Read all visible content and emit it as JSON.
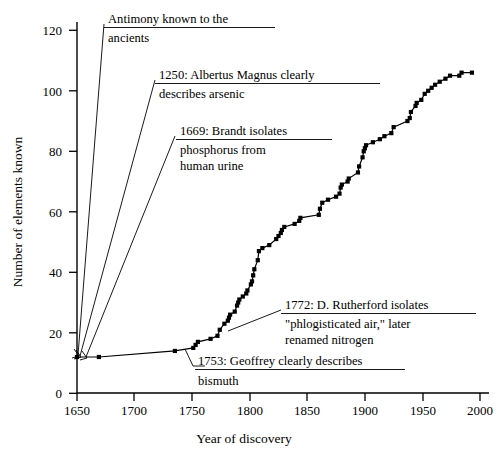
{
  "chart_data": {
    "type": "line",
    "title": "",
    "xlabel": "Year of discovery",
    "ylabel": "Number of elements known",
    "xlim": [
      1650,
      2010
    ],
    "ylim": [
      0,
      125
    ],
    "grid": false,
    "legend": "none",
    "marker": "filled-square",
    "xticks": [
      1650,
      1700,
      1750,
      1800,
      1850,
      1900,
      1950,
      2000
    ],
    "xticklabels": [
      "1650",
      "1700",
      "1750",
      "1800",
      "1850",
      "1900",
      "1950",
      "2000"
    ],
    "yticks": [
      0,
      20,
      40,
      60,
      80,
      100,
      120
    ],
    "yticklabels": [
      "0",
      "20",
      "40",
      "60",
      "80",
      "100",
      "120"
    ],
    "x": [
      1650,
      1669,
      1735,
      1751,
      1753,
      1755,
      1766,
      1772,
      1774,
      1778,
      1781,
      1782,
      1783,
      1787,
      1789,
      1790,
      1791,
      1794,
      1797,
      1798,
      1801,
      1802,
      1803,
      1804,
      1807,
      1808,
      1811,
      1817,
      1823,
      1825,
      1827,
      1828,
      1830,
      1839,
      1843,
      1844,
      1860,
      1861,
      1863,
      1868,
      1875,
      1878,
      1879,
      1880,
      1885,
      1886,
      1894,
      1895,
      1898,
      1899,
      1900,
      1901,
      1907,
      1913,
      1917,
      1923,
      1925,
      1937,
      1939,
      1940,
      1944,
      1945,
      1949,
      1952,
      1955,
      1958,
      1961,
      1965,
      1970,
      1974,
      1982,
      1984,
      1993
    ],
    "y": [
      12,
      12,
      14,
      15,
      16,
      17,
      18,
      19,
      21,
      23,
      24,
      25,
      26,
      27,
      29,
      30,
      31,
      32,
      33,
      34,
      36,
      37,
      39,
      41,
      44,
      47,
      48,
      49,
      51,
      52,
      53,
      54,
      55,
      56,
      57,
      58,
      59,
      61,
      63,
      64,
      65,
      66,
      68,
      69,
      70,
      71,
      73,
      75,
      78,
      80,
      81,
      82,
      83,
      84,
      85,
      86,
      88,
      90,
      91,
      93,
      95,
      96,
      97,
      99,
      100,
      101,
      102,
      103,
      104,
      105,
      105,
      106,
      106
    ],
    "annotations": [
      {
        "id": "antimony",
        "lines": [
          "Antimony known to the",
          "ancients"
        ],
        "underline_after_line": 1,
        "points_to": {
          "x": 1650,
          "y": 12
        }
      },
      {
        "id": "albertus-magnus",
        "lines": [
          "1250: Albertus Magnus clearly",
          "describes arsenic"
        ],
        "underline_after_line": 1,
        "points_to": {
          "x": 1650,
          "y": 12
        }
      },
      {
        "id": "brandt-phosphorus",
        "lines": [
          "1669: Brandt isolates",
          "phosphorus from",
          "human urine"
        ],
        "underline_after_line": 1,
        "points_to": {
          "x": 1669,
          "y": 12
        }
      },
      {
        "id": "rutherford-nitrogen",
        "lines": [
          "1772: D. Rutherford isolates",
          "\"phlogisticated air,\" later",
          "renamed nitrogen"
        ],
        "underline_after_line": 1,
        "points_to": {
          "x": 1772,
          "y": 19
        }
      },
      {
        "id": "geoffroy-bismuth",
        "lines": [
          "1753: Geoffrey clearly describes",
          "bismuth"
        ],
        "underline_after_line": 1,
        "points_to": {
          "x": 1753,
          "y": 16
        }
      }
    ]
  },
  "axes": {
    "y_axis_label": "Number of elements known",
    "x_axis_label": "Year of discovery"
  },
  "annotation_text": {
    "antimony_l1": "Antimony known to the",
    "antimony_l2": "ancients",
    "albertus_l1": "1250: Albertus Magnus clearly",
    "albertus_l2": "describes arsenic",
    "brandt_l1": "1669: Brandt isolates",
    "brandt_l2": "phosphorus from",
    "brandt_l3": "human urine",
    "rutherford_l1": "1772: D. Rutherford isolates",
    "rutherford_l2": "\"phlogisticated air,\" later",
    "rutherford_l3": "renamed nitrogen",
    "geoffroy_l1": "1753: Geoffrey clearly describes",
    "geoffroy_l2": "bismuth"
  },
  "ticks": {
    "y": [
      "120",
      "100",
      "80",
      "60",
      "40",
      "20",
      "0"
    ],
    "x": [
      "1650",
      "1700",
      "1750",
      "1800",
      "1850",
      "1900",
      "1950",
      "2000"
    ]
  },
  "colors": {
    "ink": "#000000",
    "background": "#ffffff"
  }
}
